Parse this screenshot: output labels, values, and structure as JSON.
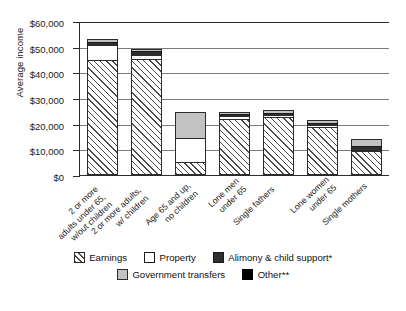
{
  "chart_data": {
    "type": "bar",
    "subtype": "stacked-bar",
    "title": "",
    "xlabel": "",
    "ylabel": "Average income",
    "ylim": [
      0,
      60000
    ],
    "ytick_step": 10000,
    "ytick_labels": [
      "$0",
      "$10,000",
      "$20,000",
      "$30,000",
      "$40,000",
      "$50,000",
      "$60,000"
    ],
    "ytick_values": [
      0,
      10000,
      20000,
      30000,
      40000,
      50000,
      60000
    ],
    "grid": "horizontal",
    "legend_position": "bottom",
    "categories": [
      "2 or more adults under 65, w/out children",
      "2 or more adults, w/ children",
      "Age 65 and up, no children",
      "Lone men under 65",
      "Single fathers",
      "Lone women under 65",
      "Single mothers"
    ],
    "category_lines": [
      [
        "2 or more",
        "adults under 65,",
        "w/out children"
      ],
      [
        "2 or more adults,",
        "w/ children"
      ],
      [
        "Age 65 and up,",
        "no children"
      ],
      [
        "Lone men",
        "under 65"
      ],
      [
        "Single fathers"
      ],
      [
        "Lone women",
        "under 65"
      ],
      [
        "Single mothers"
      ]
    ],
    "series": [
      {
        "name": "Earnings",
        "values": [
          45000,
          45300,
          5200,
          21800,
          22600,
          18600,
          9400
        ]
      },
      {
        "name": "Property",
        "values": [
          5800,
          1400,
          9200,
          1000,
          600,
          400,
          0
        ]
      },
      {
        "name": "Alimony & child support*",
        "values": [
          700,
          1600,
          0,
          700,
          500,
          500,
          2100
        ]
      },
      {
        "name": "Government transfers",
        "values": [
          1500,
          900,
          10200,
          900,
          600,
          1200,
          2600
        ]
      },
      {
        "name": "Other**",
        "values": [
          0,
          0,
          0,
          0,
          0,
          0,
          0
        ]
      }
    ],
    "totals": [
      53000,
      49200,
      24600,
      24400,
      24300,
      20700,
      14100
    ]
  },
  "legend": {
    "items": [
      {
        "label": "Earnings",
        "key": "earnings"
      },
      {
        "label": "Property",
        "key": "property"
      },
      {
        "label": "Alimony & child support*",
        "key": "alimony"
      },
      {
        "label": "Government transfers",
        "key": "govt"
      },
      {
        "label": "Other**",
        "key": "other"
      }
    ]
  },
  "colors": {
    "earnings_hatch": "#4a4a4a",
    "property": "#ffffff",
    "alimony": "#2e2e2e",
    "government_transfers": "#c2c2c2",
    "other": "#000000",
    "axis": "#2b2b2b",
    "gridline": "#7c7c7c",
    "background": "#ffffff"
  }
}
